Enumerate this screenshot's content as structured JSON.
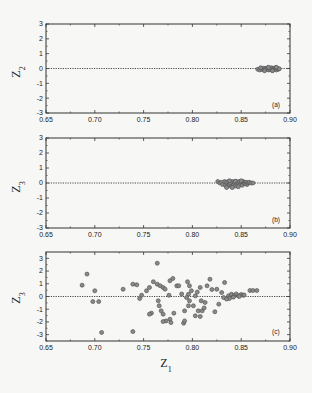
{
  "figure": {
    "xlabel": "Z",
    "xlabel_sub": "1",
    "colors": {
      "frame": "#333333",
      "point": "#555555",
      "point_fill": "#8a8a8a",
      "refline": "#333333",
      "background": "#f7f7f5"
    }
  },
  "chart_data": [
    {
      "type": "scatter",
      "panel": "(a)",
      "ylabel": "Z",
      "ylabel_sub": "2",
      "xlim": [
        0.65,
        0.9
      ],
      "ylim": [
        -3,
        3
      ],
      "xticks": [
        "0.65",
        "0.70",
        "0.75",
        "0.80",
        "0.85",
        "0.90"
      ],
      "yticks": [
        "3",
        "2",
        "1",
        "0",
        "-1",
        "-2",
        "-3"
      ],
      "reference_line": {
        "y": 0,
        "style": "dotted"
      },
      "x": [
        0.867,
        0.869,
        0.871,
        0.872,
        0.873,
        0.874,
        0.875,
        0.876,
        0.877,
        0.878,
        0.879,
        0.88,
        0.881,
        0.882,
        0.883,
        0.884,
        0.885,
        0.886,
        0.887,
        0.888,
        0.889,
        0.87,
        0.874,
        0.878,
        0.882,
        0.886
      ],
      "y": [
        -0.05,
        -0.1,
        0.0,
        -0.08,
        0.02,
        -0.1,
        0.0,
        -0.05,
        0.05,
        -0.1,
        0.0,
        -0.05,
        0.05,
        -0.12,
        0.0,
        -0.05,
        0.05,
        -0.1,
        0.0,
        -0.05,
        -0.02,
        0.05,
        -0.15,
        0.08,
        -0.15,
        0.08
      ]
    },
    {
      "type": "scatter",
      "panel": "(b)",
      "ylabel": "Z",
      "ylabel_sub": "3",
      "xlim": [
        0.65,
        0.9
      ],
      "ylim": [
        -3,
        3
      ],
      "xticks": [
        "0.65",
        "0.70",
        "0.75",
        "0.80",
        "0.85",
        "0.90"
      ],
      "yticks": [
        "3",
        "2",
        "1",
        "0",
        "-1",
        "-2",
        "-3"
      ],
      "reference_line": {
        "y": 0,
        "style": "dotted"
      },
      "x": [
        0.826,
        0.828,
        0.83,
        0.831,
        0.833,
        0.834,
        0.835,
        0.836,
        0.837,
        0.838,
        0.839,
        0.84,
        0.841,
        0.842,
        0.843,
        0.844,
        0.845,
        0.846,
        0.847,
        0.848,
        0.849,
        0.85,
        0.851,
        0.852,
        0.853,
        0.854,
        0.855,
        0.856,
        0.857,
        0.858,
        0.86,
        0.862,
        0.835,
        0.838,
        0.841,
        0.844,
        0.847,
        0.85
      ],
      "y": [
        0.1,
        0.0,
        0.05,
        -0.1,
        0.1,
        -0.15,
        0.05,
        -0.2,
        0.1,
        -0.1,
        0.0,
        -0.25,
        0.1,
        -0.15,
        0.05,
        -0.2,
        0.1,
        -0.1,
        0.0,
        0.1,
        -0.1,
        0.05,
        -0.15,
        0.1,
        0.0,
        -0.05,
        0.05,
        -0.1,
        0.0,
        0.05,
        0.0,
        0.0,
        -0.3,
        0.15,
        -0.3,
        0.12,
        -0.25,
        0.15
      ]
    },
    {
      "type": "scatter",
      "panel": "(c)",
      "ylabel": "Z",
      "ylabel_sub": "3",
      "xlim": [
        0.65,
        0.9
      ],
      "ylim": [
        -3.5,
        3.5
      ],
      "xticks": [
        "0.65",
        "0.70",
        "0.75",
        "0.80",
        "0.85",
        "0.90"
      ],
      "yticks": [
        "3",
        "2",
        "1",
        "0",
        "-1",
        "-2",
        "-3"
      ],
      "reference_line": {
        "y": 0,
        "style": "dotted"
      },
      "x": [
        0.687,
        0.692,
        0.7,
        0.698,
        0.704,
        0.707,
        0.729,
        0.739,
        0.743,
        0.746,
        0.748,
        0.739,
        0.753,
        0.756,
        0.76,
        0.764,
        0.764,
        0.767,
        0.77,
        0.772,
        0.777,
        0.78,
        0.776,
        0.765,
        0.766,
        0.768,
        0.77,
        0.758,
        0.756,
        0.773,
        0.77,
        0.777,
        0.778,
        0.781,
        0.784,
        0.786,
        0.795,
        0.797,
        0.799,
        0.796,
        0.794,
        0.797,
        0.796,
        0.792,
        0.801,
        0.803,
        0.808,
        0.815,
        0.818,
        0.809,
        0.806,
        0.81,
        0.803,
        0.808,
        0.813,
        0.791,
        0.792,
        0.825,
        0.823,
        0.827,
        0.83,
        0.832,
        0.833,
        0.837,
        0.84,
        0.843,
        0.845,
        0.847,
        0.85,
        0.852,
        0.838,
        0.842,
        0.848,
        0.853,
        0.859,
        0.862,
        0.866,
        0.789,
        0.805,
        0.812,
        0.82,
        0.835
      ],
      "y": [
        0.89,
        1.76,
        0.45,
        -0.4,
        -0.4,
        -2.83,
        0.57,
        0.97,
        0.92,
        -0.16,
        0.1,
        -2.76,
        0.45,
        0.71,
        1.16,
        2.62,
        0.97,
        0.84,
        0.71,
        0.58,
        1.24,
        1.42,
        0.1,
        -0.34,
        -0.73,
        -1.13,
        -1.39,
        -1.31,
        -1.39,
        -1.92,
        -1.97,
        -1.79,
        -2.05,
        -1.31,
        0.84,
        0.84,
        1.16,
        0.84,
        0.45,
        0.18,
        -0.08,
        -0.34,
        -0.73,
        -1.13,
        -0.73,
        0.05,
        0.71,
        0.84,
        1.36,
        -0.34,
        -1.13,
        -1.13,
        -1.52,
        -1.57,
        -0.47,
        -2.1,
        -1.92,
        0.57,
        -1.2,
        -0.6,
        0.31,
        -0.08,
        1.1,
        0.05,
        0.18,
        0.1,
        0.2,
        0.05,
        0.15,
        0.1,
        -0.15,
        -0.05,
        0.0,
        0.12,
        0.47,
        0.47,
        0.47,
        0.2,
        0.35,
        -0.9,
        0.55,
        -0.2
      ]
    }
  ]
}
